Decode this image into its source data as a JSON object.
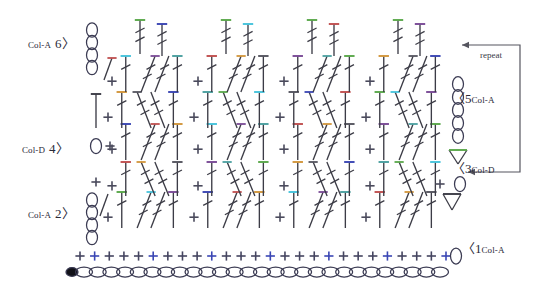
{
  "diagram": {
    "type": "crochet-pattern-chart",
    "background_color": "#ffffff",
    "ink_color": "#3c3c46",
    "chain_outline_color": "#3a3a52"
  },
  "labels": {
    "row6": {
      "color_name": "Col-A",
      "row_number": "6",
      "chevron": "〉"
    },
    "row4": {
      "color_name": "Col-D",
      "row_number": "4",
      "chevron": "〉"
    },
    "row2": {
      "color_name": "Col-A",
      "row_number": "2",
      "chevron": "〉"
    },
    "row5": {
      "color_name": "Col-A",
      "row_number": "5",
      "chevron": "〈"
    },
    "row3": {
      "color_name": "Col-D",
      "row_number": "3",
      "chevron": "〈"
    },
    "row1": {
      "color_name": "Col-A",
      "row_number": "1",
      "chevron": "〈"
    },
    "repeat": "repeat"
  },
  "legend_colors": {
    "green": "#5aa84a",
    "blue": "#3a46b4",
    "cyan": "#46c3dc",
    "red": "#c05050",
    "purple": "#7a4a96",
    "orange": "#d2963c",
    "gray": "#55555f",
    "teal": "#4aa0a0"
  },
  "chart_data": {
    "type": "table",
    "xlabel": "",
    "ylabel": "",
    "rows": [
      {
        "row": "1",
        "color": "Col-A",
        "side": "right",
        "stitches": "single crochet row (+) worked across foundation chain, ends with chain-1 turning loop"
      },
      {
        "row": "2",
        "color": "Col-A",
        "side": "left",
        "stitches": "treble / double crochet shell motif row with 4-chain turning stack at left"
      },
      {
        "row": "3",
        "color": "Col-D",
        "side": "right",
        "stitches": "double crochet and cross-stitch row, ends with cluster + chain-1 at right"
      },
      {
        "row": "4",
        "color": "Col-D",
        "side": "left",
        "stitches": "chain-1 + single crochet start, treble cluster repeats across"
      },
      {
        "row": "5",
        "color": "Col-A",
        "side": "right",
        "stitches": "cluster row, 5-chain turning stack at right"
      },
      {
        "row": "6",
        "color": "Col-A",
        "side": "left",
        "stitches": "top repeat row, 4-chain turning stack at left, repeat arrow at right"
      }
    ],
    "foundation_chain_count": 27,
    "row1_sc_count": 26,
    "pattern_repeats_per_row": 4,
    "repeat_annotation": "repeat"
  }
}
